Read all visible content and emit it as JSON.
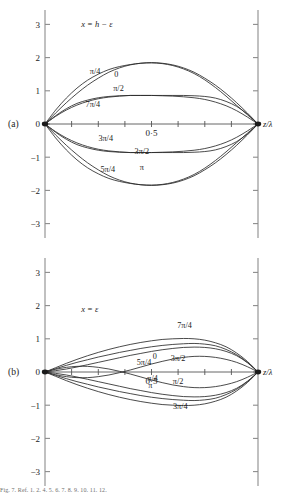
{
  "figure": {
    "caption": "Fig. 7. Ref. 1. 2. 4. 5. 6. 7. 8. 9. 10. 11. 12.",
    "axis_label_x": "z/λ"
  },
  "panels": [
    {
      "id": "a",
      "tag": "(a)",
      "annotation": "x = h − ε",
      "ylabels": [
        "3",
        "2",
        "1",
        "0",
        "−1",
        "−2",
        "−3"
      ],
      "xtick_label": "0·5",
      "axis_label": "z/λ"
    },
    {
      "id": "b",
      "tag": "(b)",
      "annotation": "x = ε",
      "ylabels": [
        "3",
        "2",
        "1",
        "0",
        "−1",
        "−2",
        "−3"
      ],
      "xtick_label": "0·5",
      "axis_label": "z/λ"
    }
  ],
  "chart_data": [
    {
      "type": "line",
      "title": "(a) x = h − ε",
      "xlabel": "z/λ",
      "ylabel": "",
      "xlim": [
        0,
        1
      ],
      "ylim": [
        -3,
        3
      ],
      "yticks": [
        -3,
        -2,
        -1,
        0,
        1,
        2,
        3
      ],
      "xticks": [
        0,
        0.125,
        0.25,
        0.375,
        0.5,
        0.625,
        0.75,
        0.875,
        1
      ],
      "xtick_labels": [
        "",
        "",
        "",
        "",
        "0·5",
        "",
        "",
        "",
        ""
      ],
      "grid": false,
      "legend": "inline-curve-labels",
      "x": [
        0,
        0.05,
        0.1,
        0.15,
        0.2,
        0.25,
        0.3,
        0.35,
        0.4,
        0.45,
        0.5,
        0.55,
        0.6,
        0.65,
        0.7,
        0.75,
        0.8,
        0.85,
        0.9,
        0.95,
        1
      ],
      "series": [
        {
          "name": "0",
          "label": "0",
          "label_pos": [
            0.335,
            1.42
          ],
          "values": [
            0,
            0.33,
            0.64,
            0.92,
            1.17,
            1.38,
            1.56,
            1.69,
            1.78,
            1.83,
            1.85,
            1.83,
            1.78,
            1.69,
            1.56,
            1.38,
            1.17,
            0.92,
            0.64,
            0.33,
            0
          ]
        },
        {
          "name": "pi/4",
          "label": "π/4",
          "label_pos": [
            0.235,
            1.5
          ],
          "values": [
            0,
            0.42,
            0.78,
            1.08,
            1.32,
            1.5,
            1.64,
            1.73,
            1.79,
            1.83,
            1.84,
            1.82,
            1.76,
            1.66,
            1.52,
            1.33,
            1.1,
            0.84,
            0.56,
            0.28,
            0
          ]
        },
        {
          "name": "pi/2",
          "label": "π/2",
          "label_pos": [
            0.345,
            0.99
          ],
          "values": [
            0,
            0.25,
            0.46,
            0.62,
            0.72,
            0.79,
            0.83,
            0.85,
            0.86,
            0.86,
            0.86,
            0.86,
            0.86,
            0.86,
            0.85,
            0.83,
            0.78,
            0.68,
            0.53,
            0.3,
            0
          ]
        },
        {
          "name": "3pi/4",
          "label": "3π/4",
          "label_pos": [
            0.285,
            -0.52
          ],
          "values": [
            0,
            -0.23,
            -0.42,
            -0.57,
            -0.68,
            -0.76,
            -0.81,
            -0.84,
            -0.86,
            -0.86,
            -0.86,
            -0.85,
            -0.84,
            -0.82,
            -0.79,
            -0.74,
            -0.66,
            -0.55,
            -0.4,
            -0.21,
            0
          ]
        },
        {
          "name": "pi",
          "label": "π",
          "label_pos": [
            0.455,
            -1.38
          ],
          "values": [
            0,
            -0.33,
            -0.64,
            -0.92,
            -1.17,
            -1.38,
            -1.56,
            -1.69,
            -1.78,
            -1.83,
            -1.85,
            -1.83,
            -1.78,
            -1.69,
            -1.56,
            -1.38,
            -1.17,
            -0.92,
            -0.64,
            -0.33,
            0
          ]
        },
        {
          "name": "5pi/4",
          "label": "5π/4",
          "label_pos": [
            0.295,
            -1.45
          ],
          "values": [
            0,
            -0.42,
            -0.78,
            -1.08,
            -1.32,
            -1.5,
            -1.64,
            -1.73,
            -1.79,
            -1.83,
            -1.84,
            -1.82,
            -1.76,
            -1.66,
            -1.52,
            -1.33,
            -1.1,
            -0.84,
            -0.56,
            -0.28,
            0
          ]
        },
        {
          "name": "3pi/2",
          "label": "3π/2",
          "label_pos": [
            0.455,
            -0.9
          ],
          "values": [
            0,
            -0.25,
            -0.46,
            -0.62,
            -0.72,
            -0.79,
            -0.83,
            -0.85,
            -0.86,
            -0.86,
            -0.86,
            -0.86,
            -0.86,
            -0.86,
            -0.85,
            -0.83,
            -0.78,
            -0.68,
            -0.53,
            -0.3,
            0
          ]
        },
        {
          "name": "7pi/4",
          "label": "7π/4",
          "label_pos": [
            0.225,
            0.52
          ],
          "values": [
            0,
            0.23,
            0.42,
            0.57,
            0.68,
            0.76,
            0.81,
            0.84,
            0.86,
            0.86,
            0.86,
            0.85,
            0.84,
            0.82,
            0.79,
            0.74,
            0.66,
            0.55,
            0.4,
            0.21,
            0
          ]
        }
      ]
    },
    {
      "type": "line",
      "title": "(b) x = ε",
      "xlabel": "z/λ",
      "ylabel": "",
      "xlim": [
        0,
        1
      ],
      "ylim": [
        -3,
        3
      ],
      "yticks": [
        -3,
        -2,
        -1,
        0,
        1,
        2,
        3
      ],
      "xticks": [
        0,
        0.125,
        0.25,
        0.375,
        0.5,
        0.625,
        0.75,
        0.875,
        1
      ],
      "xtick_labels": [
        "",
        "",
        "",
        "",
        "0·5",
        "",
        "",
        "",
        ""
      ],
      "grid": false,
      "legend": "inline-curve-labels",
      "x": [
        0,
        0.05,
        0.1,
        0.15,
        0.2,
        0.25,
        0.3,
        0.35,
        0.4,
        0.45,
        0.5,
        0.55,
        0.6,
        0.65,
        0.7,
        0.75,
        0.8,
        0.85,
        0.9,
        0.95,
        1
      ],
      "series": [
        {
          "name": "0",
          "label": "0",
          "label_pos": [
            0.515,
            0.38
          ],
          "values": [
            0,
            0.1,
            0.2,
            0.29,
            0.37,
            0.45,
            0.52,
            0.59,
            0.65,
            0.71,
            0.76,
            0.8,
            0.83,
            0.85,
            0.86,
            0.84,
            0.79,
            0.68,
            0.52,
            0.29,
            0
          ]
        },
        {
          "name": "pi/4",
          "label": "π/4",
          "label_pos": [
            0.505,
            -0.27
          ],
          "values": [
            0,
            0.08,
            0.14,
            0.17,
            0.17,
            0.14,
            0.09,
            0.02,
            -0.06,
            -0.15,
            -0.24,
            -0.32,
            -0.39,
            -0.44,
            -0.47,
            -0.47,
            -0.44,
            -0.38,
            -0.29,
            -0.16,
            0
          ]
        },
        {
          "name": "pi/2",
          "label": "π/2",
          "label_pos": [
            0.625,
            -0.36
          ],
          "values": [
            0,
            -0.04,
            -0.09,
            -0.15,
            -0.22,
            -0.29,
            -0.36,
            -0.43,
            -0.5,
            -0.56,
            -0.62,
            -0.67,
            -0.71,
            -0.74,
            -0.75,
            -0.74,
            -0.7,
            -0.62,
            -0.49,
            -0.28,
            0
          ]
        },
        {
          "name": "3pi/4",
          "label": "3π/4",
          "label_pos": [
            0.635,
            -1.12
          ],
          "values": [
            0,
            -0.13,
            -0.26,
            -0.38,
            -0.49,
            -0.59,
            -0.68,
            -0.76,
            -0.83,
            -0.89,
            -0.94,
            -0.98,
            -1.0,
            -1.01,
            -1.0,
            -0.96,
            -0.88,
            -0.76,
            -0.57,
            -0.32,
            0
          ]
        },
        {
          "name": "pi",
          "label": "π",
          "label_pos": [
            0.495,
            -0.47
          ],
          "values": [
            0,
            -0.1,
            -0.2,
            -0.29,
            -0.37,
            -0.45,
            -0.52,
            -0.59,
            -0.65,
            -0.71,
            -0.76,
            -0.8,
            -0.83,
            -0.85,
            -0.86,
            -0.84,
            -0.79,
            -0.68,
            -0.52,
            -0.29,
            0
          ]
        },
        {
          "name": "5pi/4",
          "label": "5π/4",
          "label_pos": [
            0.465,
            0.22
          ],
          "values": [
            0,
            -0.08,
            -0.14,
            -0.17,
            -0.17,
            -0.14,
            -0.09,
            -0.02,
            0.06,
            0.15,
            0.24,
            0.32,
            0.39,
            0.44,
            0.47,
            0.47,
            0.44,
            0.38,
            0.29,
            0.16,
            0
          ]
        },
        {
          "name": "3pi/2",
          "label": "3π/2",
          "label_pos": [
            0.625,
            0.33
          ],
          "values": [
            0,
            0.04,
            0.09,
            0.15,
            0.22,
            0.29,
            0.36,
            0.43,
            0.5,
            0.56,
            0.62,
            0.67,
            0.71,
            0.74,
            0.75,
            0.74,
            0.7,
            0.62,
            0.49,
            0.28,
            0
          ]
        },
        {
          "name": "7pi/4",
          "label": "7π/4",
          "label_pos": [
            0.655,
            1.32
          ],
          "values": [
            0,
            0.13,
            0.26,
            0.38,
            0.49,
            0.59,
            0.68,
            0.76,
            0.83,
            0.89,
            0.94,
            0.98,
            1.0,
            1.01,
            1.0,
            0.96,
            0.88,
            0.76,
            0.57,
            0.32,
            0
          ]
        }
      ]
    }
  ]
}
